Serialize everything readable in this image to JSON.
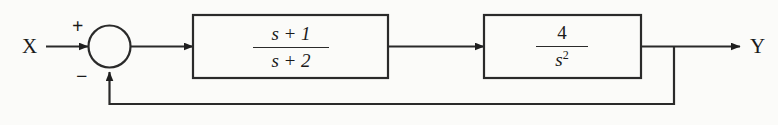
{
  "diagram": {
    "type": "control-system-block-diagram",
    "input_label": "X",
    "output_label": "Y",
    "summing_junction": {
      "name": "summing-junction",
      "plus_sign": "+",
      "minus_sign": "−",
      "plus_input": "X",
      "minus_input": "feedback"
    },
    "blocks": [
      {
        "id": "block-1",
        "numerator": "s + 1",
        "denominator": "s + 2",
        "transfer_function": "(s + 1)/(s + 2)"
      },
      {
        "id": "block-2",
        "numerator": "4",
        "denominator_base": "s",
        "denominator_exponent": "2",
        "transfer_function": "4/s^2"
      }
    ],
    "feedback": {
      "type": "unity-negative-feedback",
      "gain": "1"
    },
    "colors": {
      "line": "#2a2a2a",
      "text": "#1a1a1a",
      "background": "#fbfbf9"
    }
  }
}
